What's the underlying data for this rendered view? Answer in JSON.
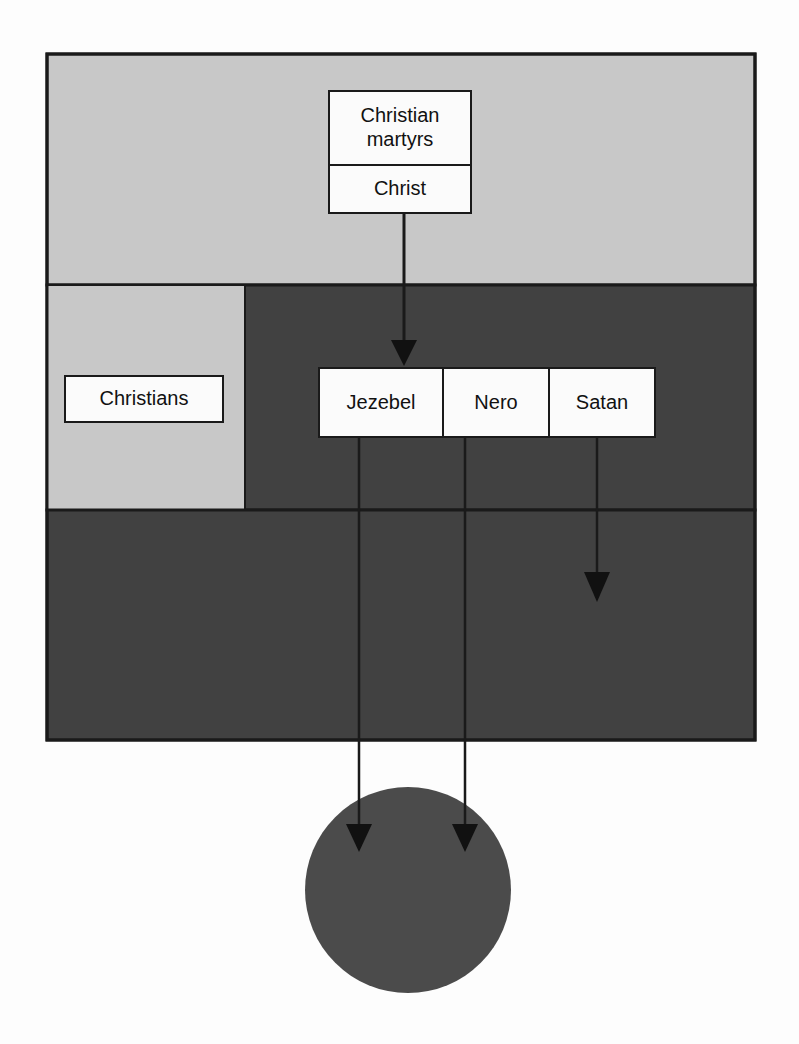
{
  "diagram": {
    "colors": {
      "page_background": "#fdfdfd",
      "light_zone": "#c8c8c8",
      "dark_zone": "#414141",
      "circle": "#4b4b4b",
      "stroke": "#1a1a1a",
      "box_fill": "#fbfbfb",
      "text": "#111111"
    },
    "zones": [
      {
        "name": "upper-light-zone",
        "fill": "#c8c8c8",
        "x": 47,
        "y": 54,
        "width": 708,
        "height": 231
      },
      {
        "name": "middle-dark-zone",
        "fill": "#414141",
        "x": 47,
        "y": 285,
        "width": 708,
        "height": 225
      },
      {
        "name": "middle-light-inset",
        "fill": "#c8c8c8",
        "x": 47,
        "y": 285,
        "width": 198,
        "height": 225
      },
      {
        "name": "lower-dark-zone",
        "fill": "#414141",
        "x": 47,
        "y": 510,
        "width": 708,
        "height": 230
      },
      {
        "name": "bottom-circle",
        "fill": "#4b4b4b",
        "cx": 408,
        "cy": 890,
        "r": 103
      }
    ],
    "nodes": {
      "christian_martyrs": "Christian\nmartyrs",
      "christ": "Christ",
      "christians": "Christians",
      "jezebel": "Jezebel",
      "nero": "Nero",
      "satan": "Satan"
    },
    "connectors": [
      {
        "name": "christ-to-jezebel-group",
        "from": "christ",
        "to": "villains-row",
        "x": 404,
        "y1": 214,
        "y2": 365,
        "arrowhead": true
      },
      {
        "name": "jezebel-to-circle",
        "from": "jezebel",
        "to": "bottom-circle",
        "x": 359,
        "y1": 438,
        "y2": 852,
        "arrowhead": true
      },
      {
        "name": "nero-to-circle",
        "from": "nero",
        "to": "bottom-circle",
        "x": 465,
        "y1": 438,
        "y2": 852,
        "arrowhead": true
      },
      {
        "name": "satan-to-lower-zone",
        "from": "satan",
        "to": "lower-dark-zone",
        "x": 597,
        "y1": 438,
        "y2": 602,
        "arrowhead": true
      }
    ]
  }
}
